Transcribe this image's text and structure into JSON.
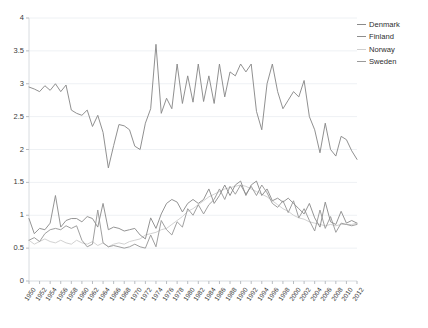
{
  "chart_data": {
    "type": "line",
    "title": "",
    "xlabel": "",
    "ylabel": "",
    "ylim": [
      0,
      4
    ],
    "xlim": [
      1950,
      2012
    ],
    "ytick_values": [
      0,
      0.5,
      1,
      1.5,
      2,
      2.5,
      3,
      3.5,
      4
    ],
    "ytick_labels": [
      "0",
      "0.5",
      "1",
      "1.5",
      "2",
      "2.5",
      "3",
      "3.5",
      "4"
    ],
    "grid": true,
    "grid_axis": "y",
    "legend_position": "top-right",
    "x": [
      1950,
      1951,
      1952,
      1953,
      1954,
      1955,
      1956,
      1957,
      1958,
      1959,
      1960,
      1961,
      1962,
      1963,
      1964,
      1965,
      1966,
      1967,
      1968,
      1969,
      1970,
      1971,
      1972,
      1973,
      1974,
      1975,
      1976,
      1977,
      1978,
      1979,
      1980,
      1981,
      1982,
      1983,
      1984,
      1985,
      1986,
      1987,
      1988,
      1989,
      1990,
      1991,
      1992,
      1993,
      1994,
      1995,
      1996,
      1997,
      1998,
      1999,
      2000,
      2001,
      2002,
      2003,
      2004,
      2005,
      2006,
      2007,
      2008,
      2009,
      2010,
      2011,
      2012
    ],
    "xtick_labels": [
      "1950",
      "1952",
      "1954",
      "1956",
      "1958",
      "1960",
      "1962",
      "1964",
      "1966",
      "1968",
      "1970",
      "1972",
      "1974",
      "1976",
      "1978",
      "1980",
      "1982",
      "1984",
      "1986",
      "1988",
      "1990",
      "1992",
      "1994",
      "1996",
      "1998",
      "2000",
      "2002",
      "2004",
      "2006",
      "2008",
      "2010",
      "2012"
    ],
    "series": [
      {
        "name": "Denmark",
        "color": "#8a8a8a",
        "values": [
          2.95,
          2.92,
          2.88,
          2.97,
          2.9,
          3.0,
          2.88,
          2.98,
          2.6,
          2.55,
          2.52,
          2.6,
          2.35,
          2.52,
          2.26,
          1.72,
          2.06,
          2.38,
          2.36,
          2.3,
          2.05,
          2.0,
          2.4,
          2.62,
          3.6,
          2.55,
          2.78,
          2.62,
          3.3,
          2.7,
          3.12,
          2.72,
          3.3,
          2.73,
          3.12,
          2.7,
          3.3,
          2.8,
          3.18,
          3.12,
          3.3,
          3.18,
          3.3,
          2.58,
          2.3,
          3.0,
          3.3,
          2.88,
          2.62,
          2.75,
          2.88,
          2.8,
          3.05,
          2.5,
          2.3,
          1.95,
          2.4,
          2.0,
          1.9,
          2.2,
          2.15,
          1.98,
          1.85
        ]
      },
      {
        "name": "Finland",
        "color": "#8e8e8e",
        "values": [
          0.95,
          0.72,
          0.8,
          0.78,
          0.88,
          1.3,
          0.82,
          0.92,
          0.95,
          0.95,
          0.9,
          0.98,
          0.95,
          0.82,
          1.18,
          0.78,
          0.82,
          0.8,
          0.76,
          0.78,
          0.8,
          0.7,
          0.64,
          0.96,
          0.8,
          1.02,
          1.18,
          1.24,
          1.2,
          1.05,
          1.18,
          1.24,
          1.18,
          1.24,
          1.4,
          1.18,
          1.3,
          1.46,
          1.3,
          1.46,
          1.52,
          1.3,
          1.46,
          1.52,
          1.3,
          1.4,
          1.22,
          1.26,
          1.2,
          1.26,
          1.18,
          1.1,
          1.02,
          1.18,
          0.96,
          0.82,
          1.2,
          0.9,
          0.86,
          1.06,
          0.88,
          0.92,
          0.88
        ]
      },
      {
        "name": "Norway",
        "color": "#cfcfcf",
        "values": [
          0.62,
          0.56,
          0.6,
          0.64,
          0.6,
          0.58,
          0.62,
          0.58,
          0.56,
          0.62,
          0.58,
          0.56,
          0.6,
          0.54,
          0.58,
          0.52,
          0.56,
          0.58,
          0.56,
          0.6,
          0.62,
          0.64,
          0.7,
          0.72,
          0.74,
          0.78,
          0.8,
          0.86,
          0.92,
          0.98,
          1.06,
          1.1,
          1.16,
          1.22,
          1.28,
          1.32,
          1.36,
          1.4,
          1.42,
          1.44,
          1.46,
          1.44,
          1.4,
          1.36,
          1.32,
          1.28,
          1.22,
          1.16,
          1.1,
          1.06,
          1.0,
          0.96,
          0.94,
          0.9,
          0.88,
          0.86,
          0.84,
          0.86,
          0.84,
          0.86,
          0.86,
          0.86,
          0.88
        ]
      },
      {
        "name": "Sweden",
        "color": "#9a9a9a",
        "values": [
          0.62,
          0.66,
          0.6,
          0.72,
          0.78,
          0.8,
          0.78,
          0.84,
          0.8,
          0.84,
          0.62,
          0.52,
          0.56,
          1.08,
          0.58,
          0.52,
          0.54,
          0.52,
          0.5,
          0.52,
          0.56,
          0.52,
          0.5,
          0.7,
          0.52,
          0.92,
          0.78,
          0.7,
          0.9,
          0.82,
          1.1,
          1.0,
          1.16,
          1.02,
          1.16,
          1.24,
          1.4,
          1.24,
          1.44,
          1.32,
          1.46,
          1.32,
          1.44,
          1.3,
          1.46,
          1.34,
          1.18,
          1.12,
          1.22,
          1.04,
          1.22,
          0.96,
          1.1,
          0.92,
          0.76,
          1.08,
          0.8,
          0.98,
          0.74,
          0.88,
          0.86,
          0.84,
          0.86
        ]
      }
    ]
  },
  "legend": {
    "items": [
      {
        "label": "Denmark"
      },
      {
        "label": "Finland"
      },
      {
        "label": "Norway"
      },
      {
        "label": "Sweden"
      }
    ]
  }
}
